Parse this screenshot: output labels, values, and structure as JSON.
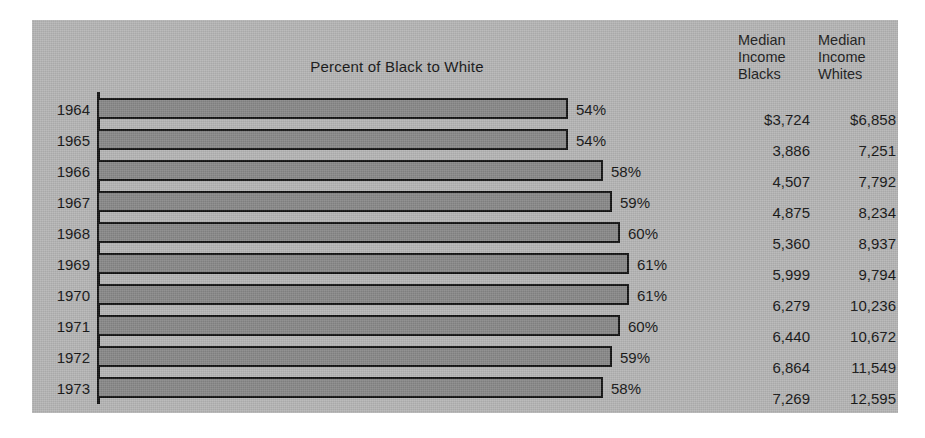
{
  "figure": {
    "title": "Percent of Black to White",
    "background_color": "#b6b6b6",
    "bar_fill_color": "#898989",
    "bar_outline_color": "#131313",
    "text_color": "#141414"
  },
  "table": {
    "header_blacks": "Median\nIncome\nBlacks",
    "header_whites": "Median\nIncome\nWhites"
  },
  "rows": [
    {
      "year": "1964",
      "percent_label": "54%",
      "percent": 54,
      "income_blacks": "$3,724",
      "income_whites": "$6,858"
    },
    {
      "year": "1965",
      "percent_label": "54%",
      "percent": 54,
      "income_blacks": "3,886",
      "income_whites": "7,251"
    },
    {
      "year": "1966",
      "percent_label": "58%",
      "percent": 58,
      "income_blacks": "4,507",
      "income_whites": "7,792"
    },
    {
      "year": "1967",
      "percent_label": "59%",
      "percent": 59,
      "income_blacks": "4,875",
      "income_whites": "8,234"
    },
    {
      "year": "1968",
      "percent_label": "60%",
      "percent": 60,
      "income_blacks": "5,360",
      "income_whites": "8,937"
    },
    {
      "year": "1969",
      "percent_label": "61%",
      "percent": 61,
      "income_blacks": "5,999",
      "income_whites": "9,794"
    },
    {
      "year": "1970",
      "percent_label": "61%",
      "percent": 61,
      "income_blacks": "6,279",
      "income_whites": "10,236"
    },
    {
      "year": "1971",
      "percent_label": "60%",
      "percent": 60,
      "income_blacks": "6,440",
      "income_whites": "10,672"
    },
    {
      "year": "1972",
      "percent_label": "59%",
      "percent": 59,
      "income_blacks": "6,864",
      "income_whites": "11,549"
    },
    {
      "year": "1973",
      "percent_label": "58%",
      "percent": 58,
      "income_blacks": "7,269",
      "income_whites": "12,595"
    }
  ],
  "chart_data": {
    "type": "bar",
    "orientation": "horizontal",
    "title": "Percent of Black to White",
    "xlabel": "",
    "ylabel": "",
    "categories": [
      "1964",
      "1965",
      "1966",
      "1967",
      "1968",
      "1969",
      "1970",
      "1971",
      "1972",
      "1973"
    ],
    "values": [
      54,
      54,
      58,
      59,
      60,
      61,
      61,
      60,
      59,
      58
    ],
    "value_labels": [
      "54%",
      "54%",
      "58%",
      "59%",
      "60%",
      "61%",
      "61%",
      "60%",
      "59%",
      "58%"
    ],
    "unit": "percent",
    "xlim": [
      0,
      61
    ],
    "grid": false,
    "legend": "none",
    "series": [
      {
        "name": "Percent of Black to White",
        "values": [
          54,
          54,
          58,
          59,
          60,
          61,
          61,
          60,
          59,
          58
        ]
      },
      {
        "name": "Median Income Blacks",
        "values": [
          3724,
          3886,
          4507,
          4875,
          5360,
          5999,
          6279,
          6440,
          6864,
          7269
        ]
      },
      {
        "name": "Median Income Whites",
        "values": [
          6858,
          7251,
          7792,
          8234,
          8937,
          9794,
          10236,
          10672,
          11549,
          12595
        ]
      }
    ],
    "table_columns": [
      "Median Income Blacks",
      "Median Income Whites"
    ]
  }
}
